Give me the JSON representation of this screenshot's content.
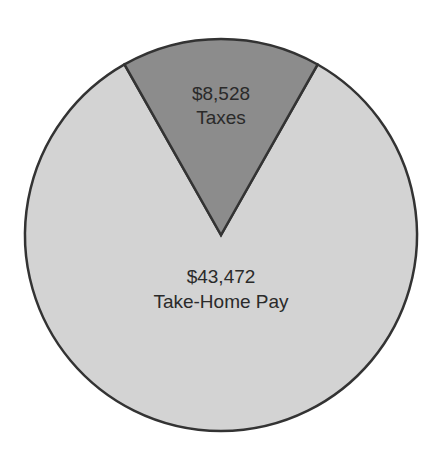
{
  "chart_data": {
    "type": "pie",
    "title": "",
    "slices": [
      {
        "label": "Taxes",
        "value": 8528,
        "display_value": "$8,528",
        "color": "#8c8c8c"
      },
      {
        "label": "Take-Home Pay",
        "value": 43472,
        "display_value": "$43,472",
        "color": "#d3d3d3"
      }
    ],
    "total": 52000,
    "start_angle_deg": -29.5,
    "legend": "none",
    "outline_color": "#333333"
  },
  "labels": {
    "taxes_value": "$8,528",
    "taxes_name": "Taxes",
    "takehome_value": "$43,472",
    "takehome_name": "Take-Home Pay"
  }
}
